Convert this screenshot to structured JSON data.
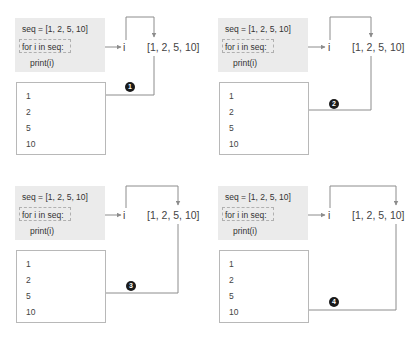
{
  "colors": {
    "line": "#8c8c8c",
    "code_background": "#ebebeb",
    "output_border": "#b8b8b8",
    "badge": "#1a1a1a",
    "text": "#3a3a3a"
  },
  "panels": [
    {
      "step": "1",
      "code": [
        "seq = [1, 2, 5, 10]",
        "for i in seq:",
        "print(i)"
      ],
      "loop_var": "i",
      "sequence": "[1, 2, 5, 10]",
      "output": [
        "1",
        "2",
        "5",
        "10"
      ],
      "current_element": "1"
    },
    {
      "step": "2",
      "code": [
        "seq = [1, 2, 5, 10]",
        "for i in seq:",
        "print(i)"
      ],
      "loop_var": "i",
      "sequence": "[1, 2, 5, 10]",
      "output": [
        "1",
        "2",
        "5",
        "10"
      ],
      "current_element": "2"
    },
    {
      "step": "3",
      "code": [
        "seq = [1, 2, 5, 10]",
        "for i in seq:",
        "print(i)"
      ],
      "loop_var": "i",
      "sequence": "[1, 2, 5, 10]",
      "output": [
        "1",
        "2",
        "5",
        "10"
      ],
      "current_element": "5"
    },
    {
      "step": "4",
      "code": [
        "seq = [1, 2, 5, 10]",
        "for i in seq:",
        "print(i)"
      ],
      "loop_var": "i",
      "sequence": "[1, 2, 5, 10]",
      "output": [
        "1",
        "2",
        "5",
        "10"
      ],
      "current_element": "10"
    }
  ]
}
